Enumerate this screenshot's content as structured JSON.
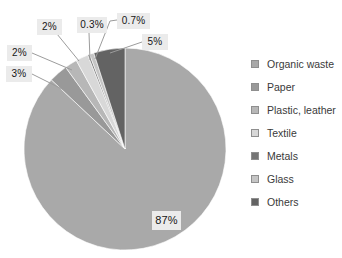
{
  "chart_data": {
    "type": "pie",
    "title": "",
    "categories": [
      "Organic waste",
      "Paper",
      "Plastic, leather",
      "Textile",
      "Metals",
      "Glass",
      "Others"
    ],
    "values": [
      87,
      3,
      2,
      2,
      0.3,
      0.7,
      5
    ],
    "slice_labels": [
      "87%",
      "3%",
      "2%",
      "2%",
      "0.3%",
      "0.7%",
      "5%"
    ],
    "colors": [
      "#a9a9a9",
      "#999999",
      "#b7b7b7",
      "#d8d8d8",
      "#757575",
      "#c5c5c5",
      "#636363"
    ],
    "unit": "%",
    "start_angle_deg": 0,
    "direction": "clockwise",
    "legend_position": "right",
    "grid": false,
    "leader_line_color": "#9c9c9c",
    "slice_separator_color": "#ffffff",
    "label_box_color": "#ebebeb"
  }
}
